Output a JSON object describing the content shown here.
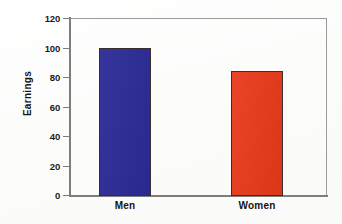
{
  "chart_data": {
    "type": "bar",
    "title": "",
    "xlabel": "",
    "ylabel": "Earnings",
    "categories": [
      "Men",
      "Women"
    ],
    "values": [
      100,
      84
    ],
    "bar_colors": [
      "#2A2A96",
      "#E8391A"
    ],
    "ylim": [
      0,
      120
    ],
    "yticks": [
      0,
      20,
      40,
      60,
      80,
      100,
      120
    ],
    "ytick_labels": [
      "0",
      "20",
      "40",
      "60",
      "80",
      "100",
      "120"
    ],
    "grid": false,
    "legend": "none",
    "series": [
      {
        "name": "Earnings",
        "points": [
          {
            "category": "Men",
            "value": 100,
            "color": "#2A2A96"
          },
          {
            "category": "Women",
            "value": 84,
            "color": "#E8391A"
          }
        ]
      }
    ]
  },
  "axis": {
    "y_title": "Earnings",
    "tick_0": "0",
    "tick_20": "20",
    "tick_40": "40",
    "tick_60": "60",
    "tick_80": "80",
    "tick_100": "100",
    "tick_120": "120"
  },
  "categories": {
    "men": "Men",
    "women": "Women"
  }
}
